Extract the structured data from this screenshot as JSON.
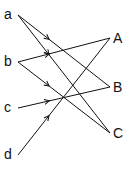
{
  "diagram": {
    "type": "bipartite mapping",
    "left_nodes": [
      {
        "id": "a",
        "label": "a",
        "x": 18,
        "y": 15
      },
      {
        "id": "b",
        "label": "b",
        "x": 18,
        "y": 62
      },
      {
        "id": "c",
        "label": "c",
        "x": 18,
        "y": 108
      },
      {
        "id": "d",
        "label": "d",
        "x": 18,
        "y": 155
      }
    ],
    "right_nodes": [
      {
        "id": "A",
        "label": "A",
        "x": 110,
        "y": 38
      },
      {
        "id": "B",
        "label": "B",
        "x": 110,
        "y": 87
      },
      {
        "id": "C",
        "label": "C",
        "x": 110,
        "y": 133
      }
    ],
    "edges": [
      {
        "from": "a",
        "to": "B"
      },
      {
        "from": "a",
        "to": "C"
      },
      {
        "from": "b",
        "to": "A"
      },
      {
        "from": "b",
        "to": "C"
      },
      {
        "from": "c",
        "to": "B"
      },
      {
        "from": "d",
        "to": "A"
      }
    ]
  }
}
